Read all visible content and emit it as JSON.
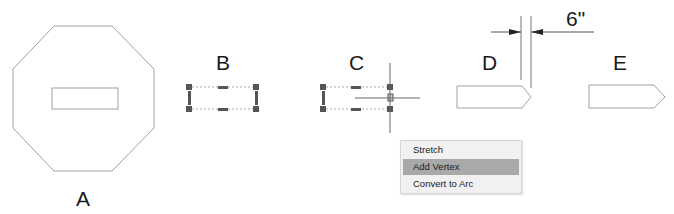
{
  "labels": {
    "a": "A",
    "b": "B",
    "c": "C",
    "d": "D",
    "e": "E"
  },
  "dimension": {
    "value": "6\""
  },
  "context_menu": {
    "items": [
      {
        "label": "Stretch",
        "highlighted": false
      },
      {
        "label": "Add Vertex",
        "highlighted": true
      },
      {
        "label": "Convert to Arc",
        "highlighted": false
      }
    ]
  },
  "colors": {
    "line": "#999999",
    "grip": "#555555",
    "highlight": "#a9a9a9",
    "menu_bg": "#f1f1f1"
  }
}
